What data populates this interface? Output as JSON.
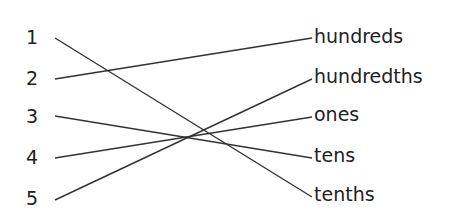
{
  "diagram": {
    "type": "matching-exercise",
    "left_items": [
      {
        "label": "1",
        "y": 38
      },
      {
        "label": "2",
        "y": 79
      },
      {
        "label": "3",
        "y": 116
      },
      {
        "label": "4",
        "y": 158
      },
      {
        "label": "5",
        "y": 200
      }
    ],
    "right_items": [
      {
        "label": "hundreds",
        "y": 38
      },
      {
        "label": "hundredths",
        "y": 79
      },
      {
        "label": "ones",
        "y": 117
      },
      {
        "label": "tens",
        "y": 158
      },
      {
        "label": "tenths",
        "y": 197
      }
    ],
    "connections": [
      {
        "from": "1",
        "to": "tenths"
      },
      {
        "from": "2",
        "to": "hundreds"
      },
      {
        "from": "3",
        "to": "tens"
      },
      {
        "from": "4",
        "to": "ones"
      },
      {
        "from": "5",
        "to": "hundredths"
      }
    ],
    "line_color": "#333333"
  }
}
